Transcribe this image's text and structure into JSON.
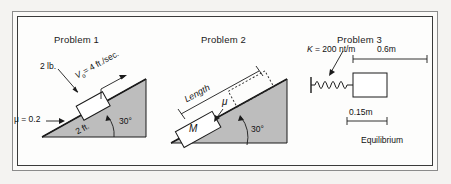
{
  "figure": {
    "background_color": "#f4f3f1",
    "page_color": "#fdfdfc",
    "incline_fill_color": "#bdbdbd",
    "ink_color": "#1b1b1b"
  },
  "problems": [
    {
      "title": "Problem 1",
      "labels": {
        "weight": "2 lb.",
        "velocity": "V",
        "velocity_sub": "o",
        "velocity_rest": "= 4 ft./sec.",
        "friction": "μ = 0.2",
        "distance": "2 ft.",
        "angle": "30°"
      }
    },
    {
      "title": "Problem 2",
      "labels": {
        "length": "Length",
        "friction": "μ",
        "mass": "M",
        "angle": "30°"
      }
    },
    {
      "title": "Problem 3",
      "labels": {
        "spring_constant": "K",
        "spring_constant_value": "= 200 nt/m",
        "distance_top": "0.6m",
        "distance_bottom": "0.15m",
        "equilibrium": "Equilibrium"
      }
    }
  ]
}
